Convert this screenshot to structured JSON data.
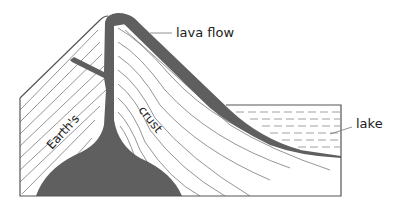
{
  "diagram": {
    "type": "volcano cross-section",
    "labels": {
      "lava_flow": "lava flow",
      "earths": "Earth's",
      "crust": "crust",
      "lake": "lake"
    },
    "colors": {
      "magma": "#5f5f5f",
      "strata_lines": "#777777",
      "outline": "#555555",
      "lake_dash": "#888888",
      "background": "#ffffff"
    }
  }
}
